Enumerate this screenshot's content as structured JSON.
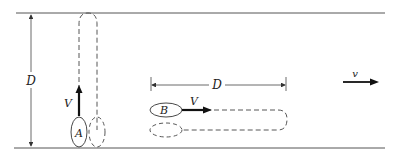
{
  "diagram": {
    "type": "physics-schematic",
    "labels": {
      "width_vertical": "D",
      "width_horizontal": "D",
      "swimmer_a": "A",
      "swimmer_b": "B",
      "velocity_a": "V",
      "velocity_b": "V",
      "river_flow": "v"
    },
    "colors": {
      "line": "#555555",
      "stroke": "#333333",
      "arrow": "#111111",
      "background": "#ffffff"
    }
  }
}
